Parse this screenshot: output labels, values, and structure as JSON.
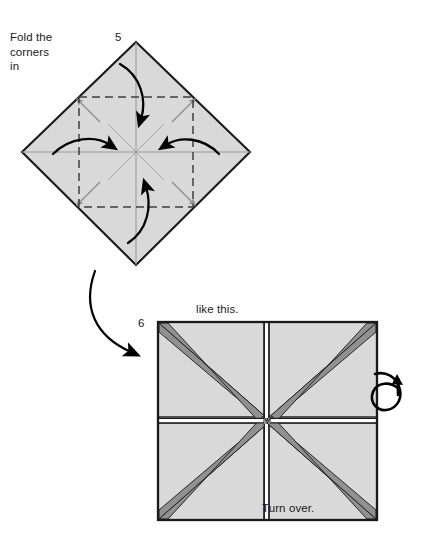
{
  "document": {
    "title": "Origami folding instructions - steps 5 and 6",
    "background_color": "#ffffff"
  },
  "palette": {
    "paper_fill": "#d9d9d9",
    "paper_shaded_fill": "#919191",
    "outline": "#1a1a1a",
    "crease_line": "#9a9a9a",
    "dashed_crease": "#4d4d4d",
    "arrow": "#000000",
    "text": "#1a1a1a"
  },
  "steps": [
    {
      "number": "5",
      "instruction": "Fold the\ncorners\nin",
      "instruction_lines": [
        "Fold the",
        "corners",
        "in"
      ],
      "shape": "diamond",
      "fold_arrow_count": 4,
      "fold_arrow_directions": [
        "top-to-center",
        "bottom-to-center",
        "left-to-center",
        "right-to-center"
      ],
      "crease_style": "dashed-inner-square"
    },
    {
      "number": "6",
      "caption_above": "like this.",
      "caption_inside": "Turn over.",
      "shape": "square",
      "pattern": "four-pointed-star",
      "panel_count": 4,
      "flip_symbol": "turn-over-loop-arrow"
    }
  ],
  "labels": {
    "fold_instruction_line1": "Fold the",
    "fold_instruction_line2": "corners",
    "fold_instruction_line3": "in",
    "step5_number": "5",
    "step6_number": "6",
    "like_this": "like this.",
    "turn_over": "Turn over."
  }
}
